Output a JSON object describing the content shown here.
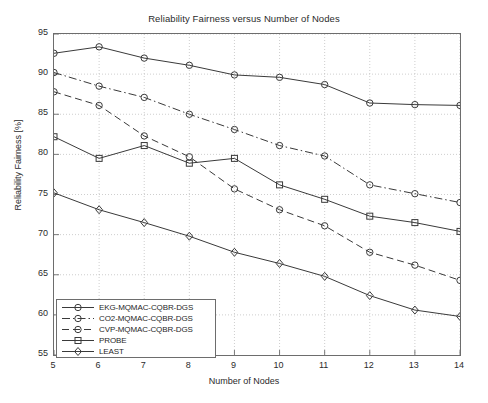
{
  "chart_data": {
    "type": "line",
    "title": "Reliability Fairness versus Number of Nodes",
    "xlabel": "Number of Nodes",
    "ylabel": "Reliability Fairness [%]",
    "xlim": [
      5,
      14
    ],
    "ylim": [
      55,
      95
    ],
    "xticks": [
      5,
      6,
      7,
      8,
      9,
      10,
      11,
      12,
      13,
      14
    ],
    "yticks": [
      55,
      60,
      65,
      70,
      75,
      80,
      85,
      90,
      95
    ],
    "grid": "dotted",
    "legend_position": "lower-left",
    "x": [
      5,
      6,
      7,
      8,
      9,
      10,
      11,
      12,
      13,
      14
    ],
    "series": [
      {
        "name": "EKG-MQMAC-CQBR-DGS",
        "values": [
          92.6,
          93.4,
          92.0,
          91.1,
          89.9,
          89.6,
          88.7,
          86.4,
          86.2,
          86.1
        ],
        "line_style": "solid",
        "marker": "circle",
        "color": "#3a3a3a"
      },
      {
        "name": "CO2-MQMAC-CQBR-DGS",
        "values": [
          90.2,
          88.5,
          87.1,
          85.0,
          83.1,
          81.1,
          79.8,
          76.2,
          75.1,
          74.0
        ],
        "line_style": "dash-dot",
        "marker": "circle",
        "color": "#3a3a3a"
      },
      {
        "name": "CVP-MQMAC-CQBR-DGS",
        "values": [
          87.8,
          86.1,
          82.3,
          79.7,
          75.7,
          73.1,
          71.1,
          67.8,
          66.2,
          64.3
        ],
        "line_style": "dashed",
        "marker": "circle",
        "color": "#3a3a3a"
      },
      {
        "name": "PROBE",
        "values": [
          82.2,
          79.5,
          81.1,
          78.9,
          79.5,
          76.2,
          74.4,
          72.3,
          71.5,
          70.4
        ],
        "line_style": "solid",
        "marker": "square",
        "color": "#3a3a3a"
      },
      {
        "name": "LEAST",
        "values": [
          75.2,
          73.1,
          71.5,
          69.8,
          67.8,
          66.4,
          64.8,
          62.4,
          60.6,
          59.8
        ],
        "line_style": "solid",
        "marker": "diamond",
        "color": "#3a3a3a"
      }
    ]
  }
}
